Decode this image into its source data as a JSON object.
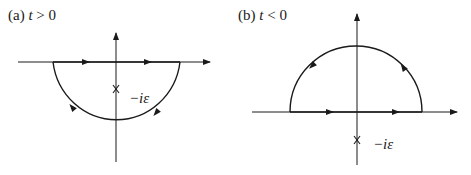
{
  "figure": {
    "panels": [
      {
        "id": "a",
        "label_prefix": "(a)",
        "condition_var": "t",
        "condition_op": ">",
        "condition_val": "0",
        "contour": "lower semicircle, clockwise",
        "pole_label": "−iε",
        "pole_marker": "X"
      },
      {
        "id": "b",
        "label_prefix": "(b)",
        "condition_var": "t",
        "condition_op": "<",
        "condition_val": "0",
        "contour": "upper semicircle, counter-clockwise",
        "pole_label": "−iε",
        "pole_marker": "X"
      }
    ],
    "colors": {
      "stroke": "#1a1a1a",
      "background": "#ffffff"
    }
  }
}
